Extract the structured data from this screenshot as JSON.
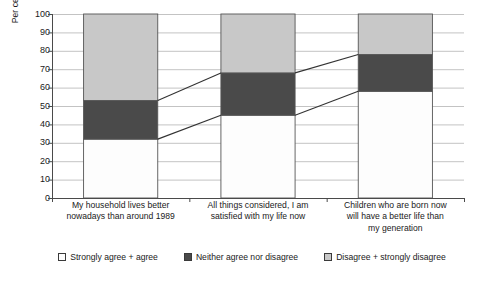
{
  "chart_data": {
    "type": "bar",
    "title": "",
    "subtitle": "",
    "xlabel": "",
    "ylabel": "Per cent of respondents",
    "ylim": [
      0,
      100
    ],
    "ytick_step": 10,
    "yticks": [
      0,
      10,
      20,
      30,
      40,
      50,
      60,
      70,
      80,
      90,
      100
    ],
    "ytick_labels": [
      "0",
      "10",
      "20",
      "30",
      "40",
      "50",
      "60",
      "70",
      "80",
      "90",
      "100"
    ],
    "grid": true,
    "grid_axis": "y",
    "stacked": true,
    "stack_total": 100,
    "legend_position": "bottom",
    "connector_lines": true,
    "categories": [
      "My household lives better nowadays than around 1989",
      "All things considered, I am satisfied with my life now",
      "Children who are born now will have a better life than my generation"
    ],
    "category_lines": [
      [
        "My household lives better",
        "nowadays than around 1989"
      ],
      [
        "All things considered, I am",
        "satisfied with my life now"
      ],
      [
        "Children who are born now",
        "will have a better life than",
        "my generation"
      ]
    ],
    "series": [
      {
        "name": "Strongly agree + agree",
        "color": "#fdfdfd",
        "values": [
          32,
          45,
          58
        ],
        "cumulative_top": [
          32,
          45,
          58
        ]
      },
      {
        "name": "Neither agree nor disagree",
        "color": "#4a4a4a",
        "values": [
          21,
          23,
          20
        ],
        "cumulative_top": [
          53,
          68,
          78
        ]
      },
      {
        "name": "Disagree + strongly disagree",
        "color": "#c8c8c8",
        "values": [
          47,
          32,
          22
        ],
        "cumulative_top": [
          100,
          100,
          100
        ]
      }
    ]
  },
  "axis": {
    "y_title": "Per cent of respondents"
  },
  "legend": {
    "items": [
      {
        "label": "Strongly agree + agree",
        "color": "#fdfdfd"
      },
      {
        "label": "Neither agree nor disagree",
        "color": "#4a4a4a"
      },
      {
        "label": "Disagree + strongly disagree",
        "color": "#c8c8c8"
      }
    ]
  },
  "footer": {
    "caption": ""
  }
}
